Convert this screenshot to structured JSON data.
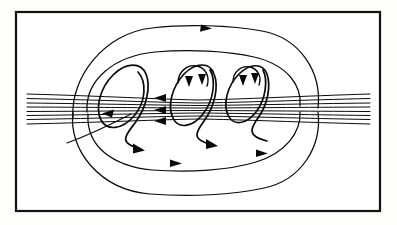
{
  "figure": {
    "type": "magnetic-field-line-diagram",
    "background_color": "#fdfdfc",
    "panel_color": "#ffffff",
    "line_color": "#0a0a0a",
    "border": {
      "x": 15,
      "y": 11,
      "width": 366,
      "height": 201,
      "stroke_width": 2.2,
      "color": "#111111"
    },
    "caption": ""
  },
  "diagram_data": {
    "type": "vector-field-lines",
    "description": "Three nested helical loops (flux-rope turns) threading a bundle of nearly horizontal sheared field lines, with large poloidal arcs closing above and below the neutral layer.",
    "axis_y": 110,
    "horizontal_bundle": {
      "name": "sheared-horizontal-field-lines",
      "count": 8,
      "left_x": 27,
      "right_x": 370,
      "pinch_center_x": 198,
      "offsets_at_edges": [
        -16,
        -11.5,
        -7,
        -3,
        1.5,
        5.5,
        9.5,
        14
      ],
      "offsets_at_center": [
        -10,
        -7,
        -4.5,
        -2,
        0.5,
        3,
        6,
        9
      ],
      "direction": "leftward",
      "arrow_count": 3,
      "arrow_x": 170,
      "arrow_ys": [
        98,
        110,
        121
      ]
    },
    "helices": [
      {
        "name": "helix-left",
        "center_x": 122,
        "center_y": 110,
        "rx": 21,
        "ry": 44,
        "tilt_deg": 18,
        "has_top_cusp": false,
        "exit_arrow": {
          "x": 143,
          "y": 150,
          "angle_deg": 40
        }
      },
      {
        "name": "helix-middle",
        "center_x": 195,
        "center_y": 108,
        "rx": 20,
        "ry": 42,
        "tilt_deg": 18,
        "has_top_cusp": true,
        "cusp_arrows": 2,
        "exit_arrow": {
          "x": 218,
          "y": 146,
          "angle_deg": 35
        }
      },
      {
        "name": "helix-right",
        "center_x": 250,
        "center_y": 107,
        "rx": 19,
        "ry": 40,
        "tilt_deg": 18,
        "has_top_cusp": true,
        "cusp_arrows": 2,
        "exit_arrow": null
      }
    ],
    "poloidal_arcs": [
      {
        "name": "outer-top-arc",
        "span_x": [
          88,
          306
        ],
        "apex_y": 31,
        "arrow": {
          "x": 205,
          "y": 31,
          "dir": "right"
        }
      },
      {
        "name": "inner-top-arc",
        "span_x": [
          100,
          292
        ],
        "apex_y": 56,
        "arrow": null
      },
      {
        "name": "outer-bottom-arc",
        "span_x": [
          88,
          306
        ],
        "apex_y": 190,
        "arrow": {
          "x": 176,
          "y": 162,
          "dir": "right"
        }
      },
      {
        "name": "inner-bottom-arc",
        "span_x": [
          100,
          292
        ],
        "apex_y": 166,
        "arrow": {
          "x": 262,
          "y": 153,
          "dir": "right"
        }
      }
    ],
    "stray_line": {
      "name": "lower-left-stray-line",
      "start": [
        70,
        140
      ],
      "end": [
        140,
        118
      ]
    },
    "arrow_total": 9
  }
}
